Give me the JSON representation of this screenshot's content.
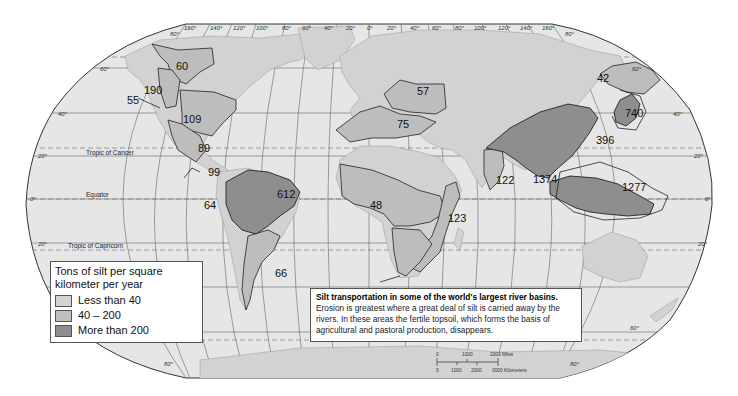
{
  "map": {
    "projection": "Robinson-like world map",
    "colors": {
      "ocean": "#e6e6e6",
      "land_unclassified": "#d2d2d2",
      "less_than_40": "#cccccc",
      "range_40_200": "#bdbdbd",
      "more_than_200": "#8e8e8e",
      "boundary": "#333333",
      "graticule": "#555555"
    },
    "longitude_ticks_top": [
      "160°",
      "140°",
      "120°",
      "100°",
      "80°",
      "60°",
      "40°",
      "20°",
      "0°",
      "20°",
      "40°",
      "60°",
      "80°",
      "100°",
      "120°",
      "140°",
      "160°"
    ],
    "latitude_ticks_left": [
      "80°",
      "60°",
      "40°",
      "20°",
      "0°",
      "20°",
      "80°"
    ],
    "latitude_ticks_right": [
      "80°",
      "60°",
      "40°",
      "20°",
      "0°",
      "20°",
      "60°",
      "80°"
    ],
    "reference_lines": {
      "tropic_of_cancer": "Tropic of Cancer",
      "equator": "Equator",
      "tropic_of_capricorn": "Tropic of Capricorn"
    },
    "basins": [
      {
        "value": "60",
        "region": "Yukon",
        "category": "40 – 200"
      },
      {
        "value": "190",
        "region": "Fraser/Columbia",
        "category": "40 – 200"
      },
      {
        "value": "55",
        "region": "Columbia",
        "category": "40 – 200"
      },
      {
        "value": "109",
        "region": "Mississippi",
        "category": "40 – 200"
      },
      {
        "value": "89",
        "region": "Rio Grande",
        "category": "40 – 200"
      },
      {
        "value": "99",
        "region": "Central America",
        "category": "40 – 200"
      },
      {
        "value": "64",
        "region": "Orinoco",
        "category": "40 – 200"
      },
      {
        "value": "612",
        "region": "Amazon",
        "category": "More than 200"
      },
      {
        "value": "66",
        "region": "Paraná",
        "category": "40 – 200"
      },
      {
        "value": "57",
        "region": "Danube",
        "category": "40 – 200"
      },
      {
        "value": "75",
        "region": "Mediterranean / Nile",
        "category": "40 – 200"
      },
      {
        "value": "48",
        "region": "Niger / Congo",
        "category": "40 – 200"
      },
      {
        "value": "123",
        "region": "Zambezi / East Africa",
        "category": "40 – 200"
      },
      {
        "value": "122",
        "region": "Indus / India",
        "category": "40 – 200"
      },
      {
        "value": "1374",
        "region": "Ganges / Brahmaputra / SE Asia",
        "category": "More than 200"
      },
      {
        "value": "42",
        "region": "Amur",
        "category": "40 – 200"
      },
      {
        "value": "740",
        "region": "Japan / Korea",
        "category": "More than 200"
      },
      {
        "value": "396",
        "region": "Yellow / Yangtze",
        "category": "More than 200"
      },
      {
        "value": "1277",
        "region": "Indonesia / New Guinea",
        "category": "More than 200"
      }
    ]
  },
  "legend": {
    "title": "Tons of silt per square kilometer per year",
    "items": [
      {
        "label": "Less than 40",
        "color": "#d4d4d4"
      },
      {
        "label": "40 – 200",
        "color": "#bfbfbf"
      },
      {
        "label": "More than 200",
        "color": "#8e8e8e"
      }
    ]
  },
  "caption": {
    "title": "Silt transportation in some of the world's largest river basins.",
    "body": "Erosion is greatest where a great deal of silt is carried away by the rivers.  In these areas the fertile topsoil, which forms the basis of agricultural and pastoral production, disappears."
  },
  "scale_bar": {
    "miles_labels": [
      "0",
      "1000",
      "2000 Miles"
    ],
    "km_labels": [
      "0",
      "1000",
      "2000",
      "3000 Kilometers"
    ]
  }
}
